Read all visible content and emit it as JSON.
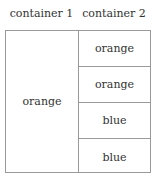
{
  "headers": [
    "container 1",
    "container 2"
  ],
  "container1": {
    "label": "orange"
  },
  "container2": {
    "items": [
      {
        "label": "orange"
      },
      {
        "label": "orange"
      },
      {
        "label": "blue"
      },
      {
        "label": "blue"
      }
    ]
  }
}
